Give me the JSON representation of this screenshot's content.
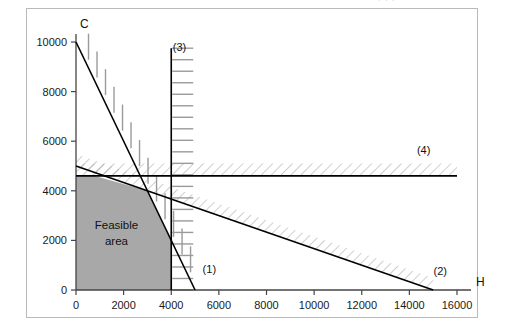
{
  "top_partial_text": "· ·   ·",
  "chart_data": {
    "type": "line",
    "title": "",
    "xlabel": "H",
    "ylabel": "C",
    "xlim": [
      0,
      16000
    ],
    "ylim": [
      0,
      10000
    ],
    "grid": false,
    "legend_position": "inline-end-labels",
    "x_ticks": [
      0,
      2000,
      4000,
      6000,
      8000,
      10000,
      12000,
      14000,
      16000
    ],
    "x_tick_labels": [
      "0",
      "2000",
      "4000",
      "6000",
      "8000",
      "10000",
      "12000",
      "14000",
      "16000"
    ],
    "y_ticks": [
      0,
      2000,
      4000,
      6000,
      8000,
      10000
    ],
    "y_tick_labels": [
      "0",
      "2000",
      "4000",
      "6000",
      "8000",
      "10000"
    ],
    "series": [
      {
        "name": "(1)",
        "label": "(1)",
        "kind": "constraint-line",
        "points": [
          [
            0,
            10000
          ],
          [
            5000,
            0
          ]
        ],
        "hatch": "vertical-ticks",
        "infeasible_side": "upper-right",
        "label_at": [
          5600,
          700
        ]
      },
      {
        "name": "(2)",
        "label": "(2)",
        "kind": "constraint-line",
        "points": [
          [
            0,
            5000
          ],
          [
            15000,
            0
          ]
        ],
        "hatch": "diagonal",
        "infeasible_side": "above",
        "label_at": [
          15300,
          620
        ]
      },
      {
        "name": "(3)",
        "label": "(3)",
        "kind": "vertical-constraint",
        "x": 4000,
        "points": [
          [
            4000,
            0
          ],
          [
            4000,
            9750
          ]
        ],
        "hatch": "horizontal-ticks",
        "infeasible_side": "right",
        "label_at": [
          4350,
          9650
        ]
      },
      {
        "name": "(4)",
        "label": "(4)",
        "kind": "horizontal-constraint",
        "y": 4600,
        "points": [
          [
            0,
            4600
          ],
          [
            16000,
            4600
          ]
        ],
        "hatch": "diagonal",
        "infeasible_side": "above",
        "label_at": [
          14600,
          5500
        ]
      }
    ],
    "regions": [
      {
        "name": "feasible-area",
        "label_lines": [
          "Feasible",
          "area"
        ],
        "fill": "#a8a8a8",
        "vertices": [
          [
            0,
            0
          ],
          [
            0,
            4600
          ],
          [
            800,
            4600
          ],
          [
            3000,
            4000
          ],
          [
            4000,
            2000
          ],
          [
            4000,
            0
          ]
        ]
      }
    ],
    "annotations": [
      {
        "text": "Feasible",
        "x": 1700,
        "y": 2450
      },
      {
        "text": "area",
        "x": 1700,
        "y": 1800
      }
    ]
  },
  "colors": {
    "frame": "#b9b9b9",
    "axis": "#444444",
    "line": "#000000",
    "feasible_fill": "#a8a8a8",
    "hatch": "#9a9a9a",
    "text": "#1a1a1a"
  }
}
